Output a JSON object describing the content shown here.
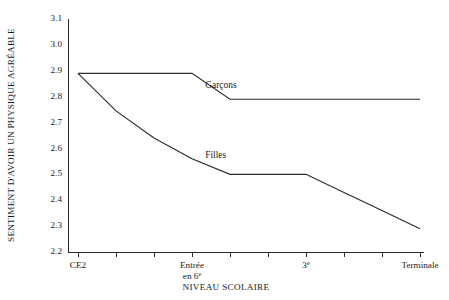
{
  "chart_data": {
    "type": "line",
    "title": "",
    "xlabel": "NIVEAU SCOLAIRE",
    "ylabel": "SENTIMENT D'AVOIR UN PHYSIQUE AGRÉABLE",
    "ylim": [
      2.2,
      3.1
    ],
    "ytick_labels": [
      "3.1",
      "3.0",
      "2.9",
      "2.8",
      "2.7",
      "2.6",
      "2.5",
      "2.4",
      "2.3",
      "2.2"
    ],
    "ytick_values": [
      3.1,
      3.0,
      2.9,
      2.8,
      2.7,
      2.6,
      2.5,
      2.4,
      2.3,
      2.2
    ],
    "grid": false,
    "legend": "inline-labels",
    "xtick_count": 10,
    "xtick_labels": [
      {
        "index": 0,
        "text": "CE2",
        "sup": ""
      },
      {
        "index": 3,
        "text": "Entrée",
        "line2": "en 6",
        "sup": "e"
      },
      {
        "index": 6,
        "text": "3",
        "sup": "e"
      },
      {
        "index": 9,
        "text": "Terminale",
        "sup": ""
      }
    ],
    "x": [
      0,
      1,
      2,
      3,
      4,
      5,
      6,
      7,
      8,
      9
    ],
    "series": [
      {
        "name": "Garçons",
        "label_x": 3.35,
        "label_y": 2.835,
        "values": [
          2.89,
          2.89,
          2.89,
          2.89,
          2.79,
          2.79,
          2.79,
          2.79,
          2.79,
          2.79
        ]
      },
      {
        "name": "Filles",
        "label_x": 3.35,
        "label_y": 2.565,
        "values": [
          2.89,
          2.745,
          2.64,
          2.56,
          2.5,
          2.5,
          2.5,
          2.43,
          2.36,
          2.29
        ]
      }
    ]
  }
}
